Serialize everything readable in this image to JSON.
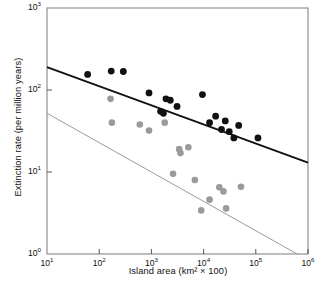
{
  "chart_data": {
    "type": "scatter",
    "title": "",
    "xlabel": "Island area (km² × 100)",
    "ylabel": "Extinction rate (per million years)",
    "xscale": "log",
    "yscale": "log",
    "xlim": [
      10,
      1000000
    ],
    "ylim": [
      1,
      1000
    ],
    "grid": false,
    "legend": "none",
    "xticks": [
      {
        "value": 10,
        "label": "10",
        "exponent": "1"
      },
      {
        "value": 100,
        "label": "10",
        "exponent": "2"
      },
      {
        "value": 1000,
        "label": "10",
        "exponent": "3"
      },
      {
        "value": 10000,
        "label": "10",
        "exponent": "4"
      },
      {
        "value": 100000,
        "label": "10",
        "exponent": "5"
      },
      {
        "value": 1000000,
        "label": "10",
        "exponent": "6"
      }
    ],
    "yticks": [
      {
        "value": 1,
        "label": "10",
        "exponent": "0"
      },
      {
        "value": 10,
        "label": "10",
        "exponent": "1"
      },
      {
        "value": 100,
        "label": "10",
        "exponent": "2"
      },
      {
        "value": 1000,
        "label": "10",
        "exponent": "3"
      }
    ],
    "series": [
      {
        "name": "black-series",
        "color": "#111111",
        "marker": "filled-circle",
        "points": [
          {
            "x": 60,
            "y": 155
          },
          {
            "x": 170,
            "y": 170
          },
          {
            "x": 290,
            "y": 168
          },
          {
            "x": 900,
            "y": 92
          },
          {
            "x": 1500,
            "y": 55
          },
          {
            "x": 1700,
            "y": 52
          },
          {
            "x": 1900,
            "y": 78
          },
          {
            "x": 2300,
            "y": 75
          },
          {
            "x": 3100,
            "y": 63
          },
          {
            "x": 9500,
            "y": 88
          },
          {
            "x": 13000,
            "y": 40
          },
          {
            "x": 17000,
            "y": 48
          },
          {
            "x": 22000,
            "y": 33
          },
          {
            "x": 26000,
            "y": 42
          },
          {
            "x": 31000,
            "y": 31
          },
          {
            "x": 38000,
            "y": 26
          },
          {
            "x": 47000,
            "y": 37
          },
          {
            "x": 110000,
            "y": 26
          }
        ]
      },
      {
        "name": "gray-series",
        "color": "#9a9a9a",
        "marker": "filled-circle",
        "points": [
          {
            "x": 165,
            "y": 78
          },
          {
            "x": 175,
            "y": 40
          },
          {
            "x": 600,
            "y": 38
          },
          {
            "x": 900,
            "y": 32
          },
          {
            "x": 1800,
            "y": 40
          },
          {
            "x": 2600,
            "y": 9.5
          },
          {
            "x": 3400,
            "y": 19
          },
          {
            "x": 3600,
            "y": 17
          },
          {
            "x": 5100,
            "y": 20
          },
          {
            "x": 6800,
            "y": 8.0
          },
          {
            "x": 9000,
            "y": 3.4
          },
          {
            "x": 13000,
            "y": 4.6
          },
          {
            "x": 20000,
            "y": 6.5
          },
          {
            "x": 24000,
            "y": 5.8
          },
          {
            "x": 27000,
            "y": 3.6
          },
          {
            "x": 52000,
            "y": 6.6
          }
        ]
      }
    ],
    "trendlines": [
      {
        "name": "black-regression-line",
        "color": "#111111",
        "x_start": 10,
        "y_start": 190,
        "x_end": 1000000,
        "y_end": 13.0
      },
      {
        "name": "gray-regression-line",
        "color": "#9a9a9a",
        "x_start": 10,
        "y_start": 52,
        "x_end": 620000,
        "y_end": 1.0
      }
    ]
  }
}
